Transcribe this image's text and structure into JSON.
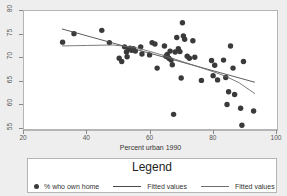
{
  "chart_data": {
    "type": "scatter",
    "title": "",
    "xlabel": "Percent urban 1990",
    "ylabel": "",
    "xlim": [
      20,
      100
    ],
    "ylim": [
      55,
      80
    ],
    "xticks": [
      20,
      40,
      60,
      80,
      100
    ],
    "yticks": [
      55,
      60,
      65,
      70,
      75,
      80
    ],
    "grid": false,
    "legend": {
      "title": "Legend",
      "position": "below-plot",
      "entries": [
        {
          "label": "% who own home",
          "type": "marker",
          "color": "#3a3a3a"
        },
        {
          "label": "Fitted values",
          "type": "line",
          "color": "#4a4a4a"
        },
        {
          "label": "Fitted values",
          "type": "line",
          "color": "#6e6e6e"
        }
      ]
    },
    "series": [
      {
        "name": "% who own home",
        "type": "scatter",
        "color": "#3a3a3a",
        "marker": "circle",
        "points": [
          [
            32.2,
            73.4
          ],
          [
            35.8,
            75.2
          ],
          [
            44.6,
            75.9
          ],
          [
            47.0,
            73.3
          ],
          [
            50.1,
            70.0
          ],
          [
            50.9,
            69.3
          ],
          [
            51.8,
            72.4
          ],
          [
            52.4,
            71.3
          ],
          [
            52.6,
            70.3
          ],
          [
            53.1,
            71.9
          ],
          [
            53.5,
            72.1
          ],
          [
            54.0,
            71.7
          ],
          [
            54.6,
            72.0
          ],
          [
            55.2,
            71.5
          ],
          [
            56.9,
            72.4
          ],
          [
            57.3,
            70.9
          ],
          [
            59.7,
            70.7
          ],
          [
            60.5,
            73.3
          ],
          [
            61.4,
            73.0
          ],
          [
            62.1,
            67.9
          ],
          [
            64.4,
            72.6
          ],
          [
            64.9,
            70.4
          ],
          [
            65.3,
            70.8
          ],
          [
            65.8,
            70.0
          ],
          [
            66.2,
            71.5
          ],
          [
            66.5,
            69.6
          ],
          [
            66.9,
            68.6
          ],
          [
            67.3,
            58.1
          ],
          [
            67.8,
            71.3
          ],
          [
            68.3,
            74.4
          ],
          [
            68.8,
            72.0
          ],
          [
            69.3,
            71.4
          ],
          [
            69.7,
            65.8
          ],
          [
            70.1,
            77.5
          ],
          [
            70.4,
            74.7
          ],
          [
            70.8,
            74.0
          ],
          [
            71.6,
            70.4
          ],
          [
            72.3,
            70.0
          ],
          [
            73.4,
            73.7
          ],
          [
            74.0,
            70.2
          ],
          [
            76.1,
            65.3
          ],
          [
            79.3,
            69.5
          ],
          [
            79.8,
            66.3
          ],
          [
            80.3,
            68.5
          ],
          [
            81.2,
            65.4
          ],
          [
            83.1,
            69.6
          ],
          [
            83.8,
            65.9
          ],
          [
            84.2,
            60.2
          ],
          [
            84.7,
            62.9
          ],
          [
            85.3,
            72.6
          ],
          [
            86.1,
            67.9
          ],
          [
            86.6,
            62.3
          ],
          [
            88.5,
            59.4
          ],
          [
            88.9,
            55.8
          ],
          [
            89.4,
            69.3
          ],
          [
            92.6,
            58.8
          ]
        ]
      },
      {
        "name": "Fitted values",
        "type": "line",
        "color": "#4a4a4a",
        "points": [
          [
            32.0,
            76.2
          ],
          [
            93.0,
            64.9
          ]
        ]
      },
      {
        "name": "Fitted values",
        "type": "line",
        "color": "#6e6e6e",
        "points": [
          [
            32.0,
            72.6
          ],
          [
            40.0,
            72.7
          ],
          [
            48.0,
            72.8
          ],
          [
            55.0,
            72.3
          ],
          [
            60.0,
            71.4
          ],
          [
            65.0,
            70.4
          ],
          [
            70.0,
            69.3
          ],
          [
            75.0,
            68.2
          ],
          [
            80.0,
            67.1
          ],
          [
            84.0,
            66.1
          ],
          [
            88.0,
            64.8
          ],
          [
            93.0,
            62.5
          ]
        ]
      }
    ]
  }
}
